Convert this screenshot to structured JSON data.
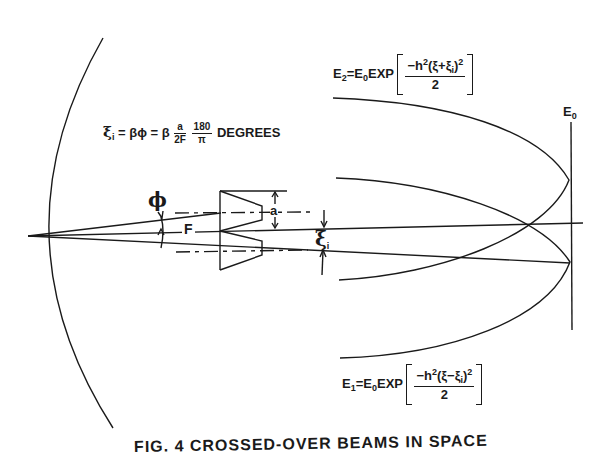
{
  "figure": {
    "caption": "FIG. 4 CROSSED-OVER BEAMS IN SPACE"
  },
  "labels": {
    "phi": "ϕ",
    "F": "F",
    "a": "a",
    "xi_i": "ξ",
    "xi_i_sub": "i",
    "E0_axis": "E",
    "E0_axis_sub": "0"
  },
  "equations": {
    "offset": {
      "lhs": "ξ",
      "lhs_sub": "i",
      "mid": " = βϕ = β",
      "frac1_num": "a",
      "frac1_den": "2F",
      "frac2_num": "180",
      "frac2_den": "π",
      "unit": "DEGREES"
    },
    "E2": {
      "lhs": "E",
      "lhs_sub": "2",
      "eq": "=",
      "rhs": "E",
      "rhs_sub": "0",
      "func": "EXP",
      "num": "−h",
      "num_sup": "2",
      "num_rest": "(ξ+ξ",
      "num_rest_sub": "i",
      "num_close": ")",
      "num_close_sup": "2",
      "den": "2"
    },
    "E1": {
      "lhs": "E",
      "lhs_sub": "1",
      "eq": "=",
      "rhs": "E",
      "rhs_sub": "0",
      "func": "EXP",
      "num": "−h",
      "num_sup": "2",
      "num_rest": "(ξ−ξ",
      "num_rest_sub": "i",
      "num_close": ")",
      "num_close_sup": "2",
      "den": "2"
    }
  },
  "colors": {
    "ink": "#1a1a1a",
    "paper": "#ffffff"
  }
}
